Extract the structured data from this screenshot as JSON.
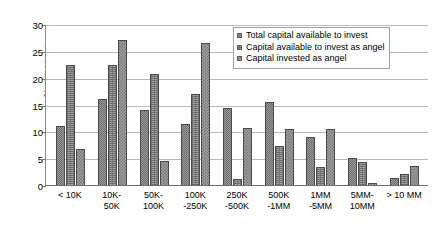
{
  "chart_data": {
    "type": "bar",
    "title": "",
    "xlabel": "",
    "ylabel": "% responses",
    "ylim": [
      0,
      30
    ],
    "yticks": [
      0,
      5,
      10,
      15,
      20,
      25,
      30
    ],
    "grid": true,
    "legend_position": "top-right",
    "categories": [
      "< 10K",
      "10K-\n50K",
      "50K-\n100K",
      "100K\n-250K",
      "250K\n-500K",
      "500K\n-1MM",
      "1MM\n-5MM",
      "5MM-\n10MM",
      "> 10 MM"
    ],
    "series": [
      {
        "name": "Total capital available to invest",
        "values": [
          11.0,
          16.0,
          14.0,
          11.3,
          14.3,
          15.5,
          9.0,
          5.0,
          1.3
        ]
      },
      {
        "name": "Capital available to invest as angel",
        "values": [
          22.3,
          22.3,
          20.6,
          17.0,
          1.2,
          7.2,
          3.3,
          4.3,
          2.0
        ]
      },
      {
        "name": "Capital invested as angel",
        "values": [
          6.8,
          27.0,
          4.5,
          26.5,
          10.7,
          10.5,
          10.5,
          0.3,
          3.5
        ]
      }
    ]
  },
  "axis": {
    "y_title": "% responses"
  }
}
